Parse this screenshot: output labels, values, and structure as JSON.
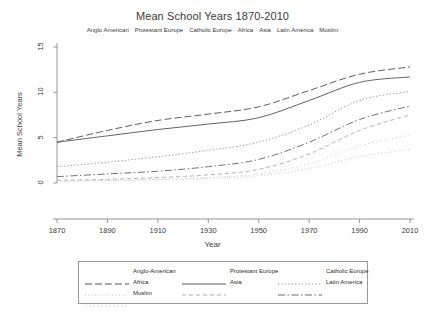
{
  "chart_data": {
    "type": "line",
    "title": "Mean School Years 1870-2010",
    "subtitle_items": [
      "Anglo American",
      "Protestant Europe",
      "Catholic Europe",
      "Africa",
      "Asia",
      "Latin America",
      "Muslim"
    ],
    "xlabel": "Year",
    "ylabel": "Mean School Years",
    "xticks": [
      1870,
      1890,
      1910,
      1930,
      1950,
      1970,
      1990,
      2010
    ],
    "yticks": [
      0,
      5,
      10,
      15
    ],
    "xlim": [
      1870,
      2010
    ],
    "ylim": [
      0,
      15
    ],
    "grid": false,
    "legend_position": "below-plot",
    "x": [
      1870,
      1890,
      1910,
      1930,
      1950,
      1970,
      1990,
      2010
    ],
    "series": [
      {
        "name": "Anglo-American",
        "style": "long-dash",
        "color": "#555555",
        "values": [
          4.5,
          5.8,
          6.9,
          7.6,
          8.4,
          10.2,
          12.0,
          12.8
        ]
      },
      {
        "name": "Protestant Europe",
        "style": "solid",
        "color": "#5a5a5a",
        "values": [
          4.5,
          5.2,
          5.9,
          6.5,
          7.2,
          9.1,
          11.1,
          11.7
        ]
      },
      {
        "name": "Catholic Europe",
        "style": "dotted",
        "color": "#9a9a9a",
        "values": [
          1.8,
          2.3,
          2.9,
          3.6,
          4.5,
          6.4,
          9.1,
          10.1
        ]
      },
      {
        "name": "Africa",
        "style": "fine-dot",
        "color": "#c2c2c2",
        "values": [
          0.2,
          0.25,
          0.35,
          0.5,
          0.8,
          1.6,
          2.9,
          3.7
        ]
      },
      {
        "name": "Asia",
        "style": "dash",
        "color": "#b0b0b0",
        "values": [
          0.3,
          0.4,
          0.6,
          0.9,
          1.5,
          3.2,
          5.8,
          7.5
        ]
      },
      {
        "name": "Latin America",
        "style": "dash-dot",
        "color": "#6a6a6a",
        "values": [
          0.7,
          1.0,
          1.3,
          1.8,
          2.6,
          4.5,
          7.0,
          8.5
        ]
      },
      {
        "name": "Muslim",
        "style": "sparse-dot",
        "color": "#cccccc",
        "values": [
          0.2,
          0.3,
          0.4,
          0.6,
          1.0,
          2.1,
          4.1,
          5.3
        ]
      }
    ]
  },
  "legend": {
    "entries": [
      {
        "label": "Anglo-American",
        "style": "long-dash",
        "col": 0,
        "row": 0
      },
      {
        "label": "Protestant Europe",
        "style": "solid",
        "col": 1,
        "row": 0
      },
      {
        "label": "Catholic Europe",
        "style": "dotted",
        "col": 2,
        "row": 0
      },
      {
        "label": "Africa",
        "style": "fine-dot",
        "col": 0,
        "row": 1
      },
      {
        "label": "Asia",
        "style": "dash",
        "col": 1,
        "row": 1
      },
      {
        "label": "Latin America",
        "style": "dash-dot",
        "col": 2,
        "row": 1
      },
      {
        "label": "Muslim",
        "style": "sparse-dot",
        "col": 0,
        "row": 2
      }
    ]
  }
}
